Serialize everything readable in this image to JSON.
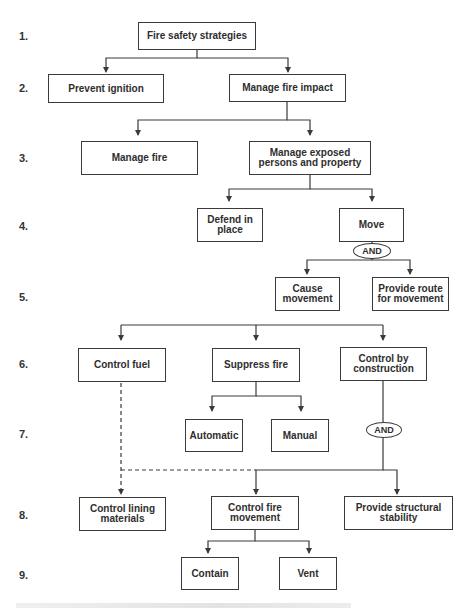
{
  "diagram": {
    "type": "hierarchical-flowchart",
    "levels": [
      "1.",
      "2.",
      "3.",
      "4.",
      "5.",
      "6.",
      "7.",
      "8.",
      "9."
    ],
    "nodes": {
      "fire_safety_strategies": "Fire safety strategies",
      "prevent_ignition": "Prevent ignition",
      "manage_fire_impact": "Manage fire impact",
      "manage_fire": "Manage fire",
      "manage_exposed": "Manage exposed persons and property",
      "defend_in_place": "Defend in place",
      "move": "Move",
      "and_1": "AND",
      "cause_movement": "Cause movement",
      "provide_route": "Provide route for movement",
      "control_fuel": "Control fuel",
      "suppress_fire": "Suppress fire",
      "control_by_construction": "Control by construction",
      "automatic": "Automatic",
      "manual": "Manual",
      "and_2": "AND",
      "control_lining": "Control lining materials",
      "control_fire_movement": "Control fire movement",
      "provide_structural": "Provide structural stability",
      "contain": "Contain",
      "vent": "Vent"
    },
    "line_color": "#3a3a3a"
  }
}
